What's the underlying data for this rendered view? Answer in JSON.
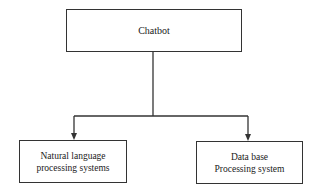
{
  "diagram": {
    "type": "tree",
    "root": {
      "id": "chatbot",
      "label": "Chatbot"
    },
    "children": [
      {
        "id": "nlp",
        "label": "Natural language\nprocessing systems"
      },
      {
        "id": "db",
        "label": "Data base\nProcessing system"
      }
    ],
    "edges": [
      {
        "from": "chatbot",
        "to": "nlp",
        "style": "arrow"
      },
      {
        "from": "chatbot",
        "to": "db",
        "style": "arrow"
      }
    ],
    "colors": {
      "line": "#333333",
      "background": "#ffffff",
      "text": "#1a1a1a"
    }
  }
}
